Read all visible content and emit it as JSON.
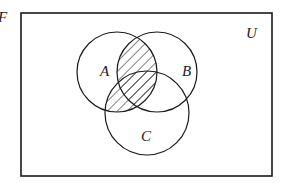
{
  "figure_label": "F",
  "universe": {
    "label": "U",
    "rect": {
      "x": 21,
      "y": 13,
      "w": 251,
      "h": 163
    }
  },
  "sets": [
    {
      "id": "A",
      "label": "A",
      "cx": 117,
      "cy": 72,
      "r": 40,
      "label_x": 106,
      "label_y": 75
    },
    {
      "id": "B",
      "label": "B",
      "cx": 157,
      "cy": 72,
      "r": 40,
      "label_x": 187,
      "label_y": 75
    },
    {
      "id": "C",
      "label": "C",
      "cx": 147,
      "cy": 113,
      "r": 42,
      "label_x": 147,
      "label_y": 140
    }
  ],
  "shaded_region": "A ∩ (B ∪ C)",
  "colors": {
    "stroke": "#1a1a1a",
    "background": "#ffffff",
    "hatch": "#1a1a1a"
  }
}
